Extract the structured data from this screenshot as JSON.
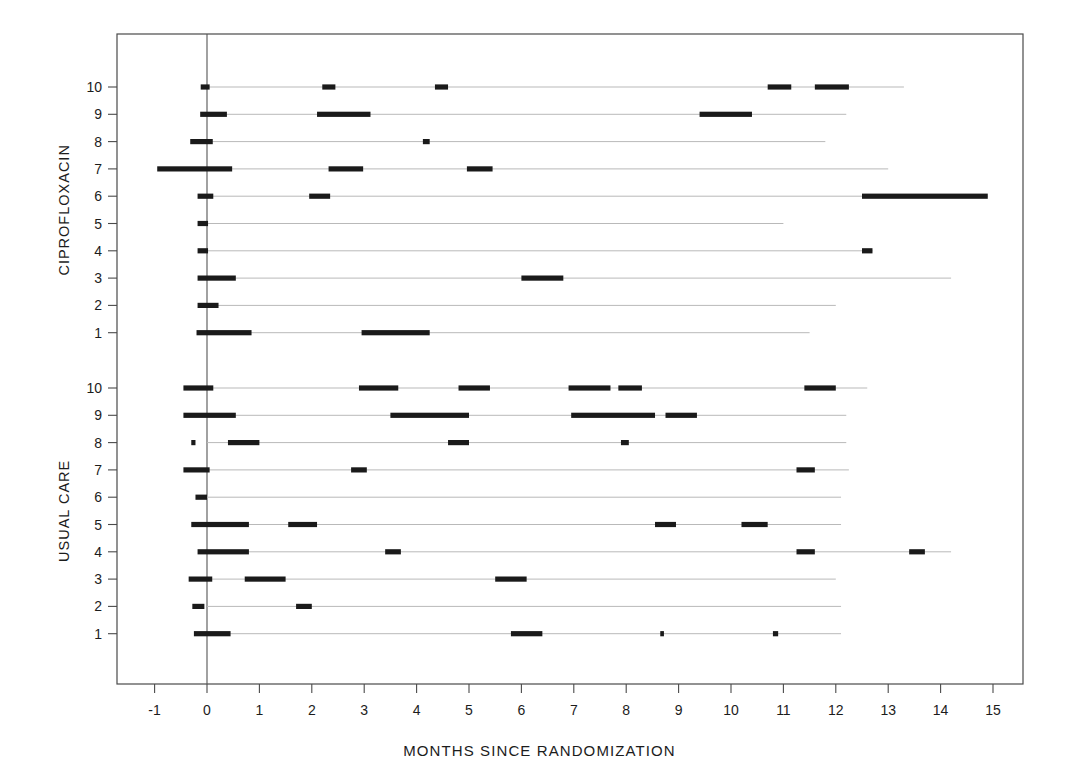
{
  "chart_data": {
    "type": "timeline",
    "title": "",
    "xlabel": "MONTHS SINCE RANDOMIZATION",
    "ylabel": "",
    "xlim": [
      -1.6,
      15.6
    ],
    "xticks": [
      -1,
      0,
      1,
      2,
      3,
      4,
      5,
      6,
      7,
      8,
      9,
      10,
      11,
      12,
      13,
      14,
      15
    ],
    "xticklabels": [
      "-1",
      "0",
      "1",
      "2",
      "3",
      "4",
      "5",
      "6",
      "7",
      "8",
      "9",
      "10",
      "11",
      "12",
      "13",
      "14",
      "15"
    ],
    "grid": false,
    "reference_line_x": 0,
    "legend": "none",
    "colors": {
      "bar": "#1a1a1a",
      "baseline": "#b9b9b9",
      "frame": "#4a4a4a",
      "background": "#ffffff"
    },
    "groups": [
      {
        "name": "CIPROFLOXACIN",
        "yticklabels": [
          "10",
          "9",
          "8",
          "7",
          "6",
          "5",
          "4",
          "3",
          "2",
          "1"
        ],
        "subjects": [
          {
            "id": "10",
            "line_end": 13.3,
            "segments": [
              [
                -0.12,
                0.05
              ],
              [
                2.2,
                2.45
              ],
              [
                4.35,
                4.6
              ],
              [
                10.7,
                11.15
              ],
              [
                11.6,
                12.25
              ]
            ]
          },
          {
            "id": "9",
            "line_end": 12.2,
            "segments": [
              [
                -0.13,
                0.38
              ],
              [
                2.1,
                3.12
              ],
              [
                9.4,
                10.4
              ]
            ]
          },
          {
            "id": "8",
            "line_end": 11.8,
            "segments": [
              [
                -0.32,
                0.11
              ],
              [
                4.12,
                4.25
              ]
            ]
          },
          {
            "id": "7",
            "line_end": 13.0,
            "segments": [
              [
                -0.95,
                0.48
              ],
              [
                2.32,
                2.98
              ],
              [
                4.96,
                5.45
              ]
            ]
          },
          {
            "id": "6",
            "line_end": 14.9,
            "segments": [
              [
                -0.18,
                0.12
              ],
              [
                1.95,
                2.35
              ],
              [
                12.5,
                14.9
              ]
            ]
          },
          {
            "id": "5",
            "line_end": 11.0,
            "segments": [
              [
                -0.18,
                0.02
              ]
            ]
          },
          {
            "id": "4",
            "line_end": 12.7,
            "segments": [
              [
                -0.18,
                0.02
              ],
              [
                12.5,
                12.7
              ]
            ]
          },
          {
            "id": "3",
            "line_end": 14.2,
            "segments": [
              [
                -0.18,
                0.55
              ],
              [
                6.0,
                6.8
              ]
            ]
          },
          {
            "id": "2",
            "line_end": 12.0,
            "segments": [
              [
                -0.18,
                0.22
              ]
            ]
          },
          {
            "id": "1",
            "line_end": 11.5,
            "segments": [
              [
                -0.2,
                0.85
              ],
              [
                2.95,
                4.25
              ]
            ]
          }
        ]
      },
      {
        "name": "USUAL CARE",
        "yticklabels": [
          "10",
          "9",
          "8",
          "7",
          "6",
          "5",
          "4",
          "3",
          "2",
          "1"
        ],
        "subjects": [
          {
            "id": "10",
            "line_end": 12.6,
            "segments": [
              [
                -0.45,
                0.12
              ],
              [
                2.9,
                3.65
              ],
              [
                4.8,
                5.4
              ],
              [
                6.9,
                7.7
              ],
              [
                7.85,
                8.3
              ],
              [
                11.4,
                12.0
              ]
            ]
          },
          {
            "id": "9",
            "line_end": 12.2,
            "segments": [
              [
                -0.45,
                0.55
              ],
              [
                3.5,
                5.0
              ],
              [
                6.95,
                8.55
              ],
              [
                8.75,
                9.35
              ]
            ]
          },
          {
            "id": "8",
            "line_end": 12.2,
            "segments": [
              [
                -0.3,
                -0.22
              ],
              [
                0.4,
                1.0
              ],
              [
                4.6,
                5.0
              ],
              [
                7.9,
                8.05
              ]
            ]
          },
          {
            "id": "7",
            "line_end": 12.25,
            "segments": [
              [
                -0.45,
                0.05
              ],
              [
                2.75,
                3.05
              ],
              [
                11.25,
                11.6
              ]
            ]
          },
          {
            "id": "6",
            "line_end": 12.1,
            "segments": [
              [
                -0.22,
                0.0
              ]
            ]
          },
          {
            "id": "5",
            "line_end": 12.1,
            "segments": [
              [
                -0.3,
                0.8
              ],
              [
                1.55,
                2.1
              ],
              [
                8.55,
                8.95
              ],
              [
                10.2,
                10.7
              ]
            ]
          },
          {
            "id": "4",
            "line_end": 14.2,
            "segments": [
              [
                -0.18,
                0.8
              ],
              [
                3.4,
                3.7
              ],
              [
                11.25,
                11.6
              ],
              [
                13.4,
                13.7
              ]
            ]
          },
          {
            "id": "3",
            "line_end": 12.0,
            "segments": [
              [
                -0.35,
                0.1
              ],
              [
                0.72,
                1.5
              ],
              [
                5.5,
                6.1
              ]
            ]
          },
          {
            "id": "2",
            "line_end": 12.1,
            "segments": [
              [
                -0.28,
                -0.05
              ],
              [
                1.7,
                2.0
              ]
            ]
          },
          {
            "id": "1",
            "line_end": 12.1,
            "segments": [
              [
                -0.25,
                0.45
              ],
              [
                5.8,
                6.4
              ],
              [
                8.65,
                8.72
              ],
              [
                10.8,
                10.9
              ]
            ]
          }
        ]
      }
    ]
  }
}
